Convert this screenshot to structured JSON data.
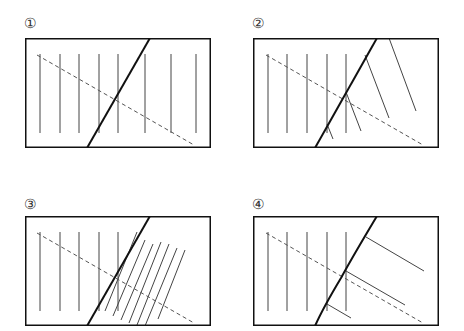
{
  "panels": [
    {
      "label": "①",
      "label_pos": [
        24,
        16
      ],
      "box": {
        "x": 25,
        "y": 38,
        "w": 186,
        "h": 110
      },
      "verticals": {
        "xs": [
          15,
          35,
          54,
          74,
          93,
          120,
          146,
          171
        ],
        "y1": 16,
        "y2": 95
      },
      "fault": {
        "path": "M125,0 L62,110"
      },
      "dashed": {
        "x1": 12,
        "y1": 17,
        "x2": 169,
        "y2": 107
      },
      "extra_lines": []
    },
    {
      "label": "②",
      "label_pos": [
        252,
        16
      ],
      "box": {
        "x": 253,
        "y": 38,
        "w": 186,
        "h": 110
      },
      "verticals": {
        "xs": [
          15,
          34,
          54,
          74,
          93
        ],
        "y1": 16,
        "y2": 95
      },
      "fault": {
        "path": "M124,0 L62,110"
      },
      "dashed": {
        "x1": 13,
        "y1": 17,
        "x2": 170,
        "y2": 107
      },
      "extra_lines": [
        {
          "x1": 74,
          "y1": 86,
          "x2": 80,
          "y2": 101
        },
        {
          "x1": 93,
          "y1": 54,
          "x2": 108,
          "y2": 93
        },
        {
          "x1": 112,
          "y1": 17,
          "x2": 136,
          "y2": 80
        },
        {
          "x1": 136,
          "y1": 0,
          "x2": 163,
          "y2": 73
        }
      ]
    },
    {
      "label": "③",
      "label_pos": [
        24,
        197
      ],
      "box": {
        "x": 25,
        "y": 216,
        "w": 186,
        "h": 110
      },
      "verticals": {
        "xs": [
          15,
          35,
          54,
          74,
          93
        ],
        "y1": 16,
        "y2": 95
      },
      "fault": {
        "path": "M125,0 L62,110"
      },
      "dashed": {
        "x1": 12,
        "y1": 17,
        "x2": 169,
        "y2": 107
      },
      "extra_lines": [
        {
          "x1": 112,
          "y1": 16,
          "x2": 80,
          "y2": 95
        },
        {
          "x1": 120,
          "y1": 24,
          "x2": 88,
          "y2": 100
        },
        {
          "x1": 128,
          "y1": 28,
          "x2": 96,
          "y2": 104
        },
        {
          "x1": 136,
          "y1": 26,
          "x2": 104,
          "y2": 107
        },
        {
          "x1": 144,
          "y1": 28,
          "x2": 112,
          "y2": 109
        },
        {
          "x1": 152,
          "y1": 32,
          "x2": 120,
          "y2": 110
        },
        {
          "x1": 160,
          "y1": 34,
          "x2": 133,
          "y2": 103
        }
      ]
    },
    {
      "label": "④",
      "label_pos": [
        252,
        197
      ],
      "box": {
        "x": 253,
        "y": 216,
        "w": 186,
        "h": 110
      },
      "verticals": {
        "xs": [
          15,
          34,
          54,
          74,
          93
        ],
        "y1": 16,
        "y2": 95
      },
      "fault": {
        "path": "M124,0 Q100,40 88,62 Q70,92 62,110"
      },
      "dashed": {
        "x1": 13,
        "y1": 17,
        "x2": 170,
        "y2": 107
      },
      "extra_lines": [
        {
          "x1": 74,
          "y1": 88,
          "x2": 98,
          "y2": 102
        },
        {
          "x1": 93,
          "y1": 55,
          "x2": 152,
          "y2": 89
        },
        {
          "x1": 113,
          "y1": 21,
          "x2": 171,
          "y2": 55
        }
      ]
    }
  ],
  "colors": {
    "frame": "#111111",
    "fault": "#111111",
    "strata": "#444444",
    "dashed": "#555555",
    "label": "#333333"
  }
}
